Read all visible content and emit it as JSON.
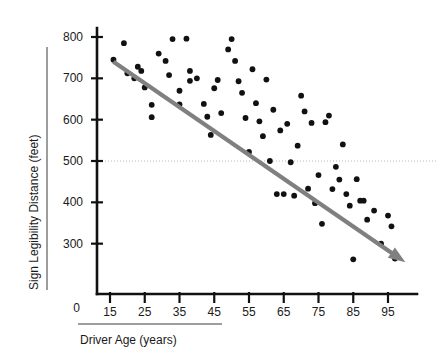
{
  "chart_data": {
    "type": "scatter",
    "title": "",
    "xlabel": "Driver Age (years)",
    "ylabel": "Sign Legibility Distance (feet)",
    "xlim": [
      10,
      100
    ],
    "ylim": [
      230,
      830
    ],
    "x_ticks": [
      15,
      25,
      35,
      45,
      55,
      65,
      75,
      85,
      95
    ],
    "y_ticks": [
      300,
      400,
      500,
      600,
      700,
      800
    ],
    "y_origin_label": "0",
    "grid": false,
    "legend": "none",
    "reference_lines": [
      {
        "orientation": "horizontal",
        "value": 500,
        "style": "dotted",
        "color": "#b8b8b8"
      }
    ],
    "annotations": [
      {
        "type": "trend-arrow",
        "color": "#808080",
        "x_start": 16,
        "y_start": 740,
        "x_end": 100,
        "y_end": 255
      }
    ],
    "series": [
      {
        "name": "Drivers",
        "marker": "filled-circle",
        "color": "#111111",
        "points": [
          [
            16,
            745
          ],
          [
            19,
            785
          ],
          [
            20,
            712
          ],
          [
            22,
            700
          ],
          [
            23,
            728
          ],
          [
            24,
            718
          ],
          [
            25,
            678
          ],
          [
            27,
            636
          ],
          [
            27,
            606
          ],
          [
            29,
            760
          ],
          [
            31,
            742
          ],
          [
            32,
            708
          ],
          [
            33,
            795
          ],
          [
            35,
            670
          ],
          [
            35,
            637
          ],
          [
            37,
            796
          ],
          [
            38,
            718
          ],
          [
            38,
            694
          ],
          [
            40,
            700
          ],
          [
            42,
            638
          ],
          [
            43,
            607
          ],
          [
            44,
            563
          ],
          [
            45,
            676
          ],
          [
            46,
            696
          ],
          [
            47,
            616
          ],
          [
            49,
            770
          ],
          [
            50,
            795
          ],
          [
            51,
            742
          ],
          [
            52,
            693
          ],
          [
            53,
            665
          ],
          [
            54,
            604
          ],
          [
            55,
            522
          ],
          [
            56,
            722
          ],
          [
            57,
            640
          ],
          [
            58,
            596
          ],
          [
            59,
            560
          ],
          [
            60,
            697
          ],
          [
            61,
            500
          ],
          [
            62,
            624
          ],
          [
            63,
            420
          ],
          [
            64,
            574
          ],
          [
            65,
            420
          ],
          [
            66,
            590
          ],
          [
            67,
            497
          ],
          [
            68,
            416
          ],
          [
            69,
            537
          ],
          [
            70,
            658
          ],
          [
            71,
            620
          ],
          [
            72,
            433
          ],
          [
            73,
            592
          ],
          [
            74,
            398
          ],
          [
            75,
            466
          ],
          [
            76,
            348
          ],
          [
            77,
            594
          ],
          [
            78,
            610
          ],
          [
            79,
            432
          ],
          [
            80,
            486
          ],
          [
            81,
            455
          ],
          [
            82,
            540
          ],
          [
            83,
            420
          ],
          [
            84,
            392
          ],
          [
            85,
            262
          ],
          [
            86,
            456
          ],
          [
            87,
            404
          ],
          [
            88,
            404
          ],
          [
            89,
            358
          ],
          [
            91,
            380
          ],
          [
            93,
            300
          ],
          [
            95,
            368
          ],
          [
            96,
            342
          ],
          [
            97,
            264
          ]
        ]
      }
    ]
  },
  "axis": {
    "y_title": "Sign Legibility Distance (feet)",
    "x_title": "Driver Age (years)"
  }
}
